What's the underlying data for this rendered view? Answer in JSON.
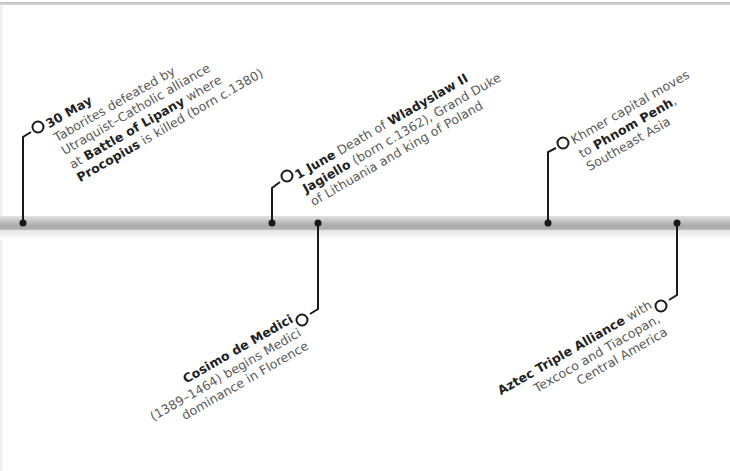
{
  "timeline": {
    "accent_color": "#1a1a1a",
    "bar_color": "#b4b4b4",
    "events": [
      {
        "id": "battle-of-lipany",
        "position": "above",
        "date": "30 May",
        "lines": [
          {
            "parts": [
              {
                "text": "30 May",
                "bold": true
              }
            ]
          },
          {
            "parts": [
              {
                "text": "Taborites defeated by",
                "bold": false
              }
            ]
          },
          {
            "parts": [
              {
                "text": "Utraquist–Catholic alliance",
                "bold": false
              }
            ]
          },
          {
            "parts": [
              {
                "text": "at ",
                "bold": false
              },
              {
                "text": "Battle of Lipany",
                "bold": true
              },
              {
                "text": " where",
                "bold": false
              }
            ]
          },
          {
            "parts": [
              {
                "text": "Procopius",
                "bold": true
              },
              {
                "text": " is killed (born c.1380)",
                "bold": false
              }
            ]
          }
        ]
      },
      {
        "id": "death-wladyslaw",
        "position": "above",
        "date": "1 June",
        "lines": [
          {
            "parts": [
              {
                "text": "1 June",
                "bold": true
              },
              {
                "text": " Death of ",
                "bold": false
              },
              {
                "text": "Wladyslaw II",
                "bold": true
              }
            ]
          },
          {
            "parts": [
              {
                "text": "Jagiello",
                "bold": true
              },
              {
                "text": " (born c.1362), Grand Duke",
                "bold": false
              }
            ]
          },
          {
            "parts": [
              {
                "text": "of Lithuania and king of Poland",
                "bold": false
              }
            ]
          }
        ]
      },
      {
        "id": "cosimo-de-medici",
        "position": "below",
        "lines": [
          {
            "parts": [
              {
                "text": "Cosimo de Medici",
                "bold": true
              }
            ]
          },
          {
            "parts": [
              {
                "text": "(1389–1464) begins Medici",
                "bold": false
              }
            ]
          },
          {
            "parts": [
              {
                "text": "dominance in Florence",
                "bold": false
              }
            ]
          }
        ]
      },
      {
        "id": "khmer-capital",
        "position": "above",
        "lines": [
          {
            "parts": [
              {
                "text": "Khmer capital moves",
                "bold": false
              }
            ]
          },
          {
            "parts": [
              {
                "text": "to ",
                "bold": false
              },
              {
                "text": "Phnom Penh",
                "bold": true
              },
              {
                "text": ",",
                "bold": false
              }
            ]
          },
          {
            "parts": [
              {
                "text": "Southeast Asia",
                "bold": false
              }
            ]
          }
        ]
      },
      {
        "id": "aztec-triple-alliance",
        "position": "below",
        "lines": [
          {
            "parts": [
              {
                "text": "Aztec Triple Alliance",
                "bold": true
              },
              {
                "text": " with",
                "bold": false
              }
            ]
          },
          {
            "parts": [
              {
                "text": "Texcoco and Tiacopan,",
                "bold": false
              }
            ]
          },
          {
            "parts": [
              {
                "text": "Central America",
                "bold": false
              }
            ]
          }
        ]
      }
    ]
  }
}
